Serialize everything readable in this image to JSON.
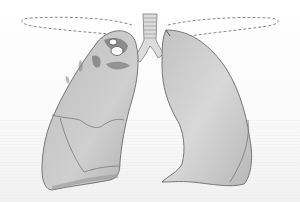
{
  "figure": {
    "subject": "Illustration of human lungs with trachea",
    "colors": {
      "background": "#ffffff",
      "lung_fill": "#c4c4c4",
      "lung_light": "#e2e2e2",
      "lung_outline": "#6a6a6a",
      "lesion": "#7a7a7a",
      "dashed_outline": "#8a8a8a",
      "trachea": "#d8d8d8"
    },
    "parts": [
      "trachea",
      "right-lung",
      "left-lung",
      "dashed-apex-outline-left",
      "dashed-apex-outline-right",
      "upper-lobe-lesions",
      "cavities"
    ]
  }
}
